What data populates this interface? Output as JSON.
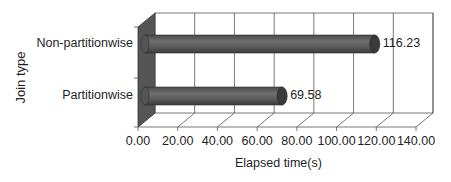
{
  "chart_data": {
    "type": "bar",
    "orientation": "horizontal",
    "style": "3d-cylinder",
    "title": "",
    "xlabel": "Elapsed time(s)",
    "ylabel": "Join type",
    "categories": [
      "Non-partitionwise",
      "Partitionwise"
    ],
    "values": [
      116.23,
      69.58
    ],
    "data_labels": [
      "116.23",
      "69.58"
    ],
    "xlim": [
      0,
      140
    ],
    "x_ticks": [
      "0.00",
      "20.00",
      "40.00",
      "60.00",
      "80.00",
      "100.00",
      "120.00",
      "140.00"
    ],
    "grid": true,
    "legend": null,
    "colors": {
      "bar": "#5a5a5a",
      "bar_highlight": "#7a7a7a",
      "bar_end": "#3a3a3a",
      "side_wall": "#555555",
      "grid": "#555555"
    }
  }
}
